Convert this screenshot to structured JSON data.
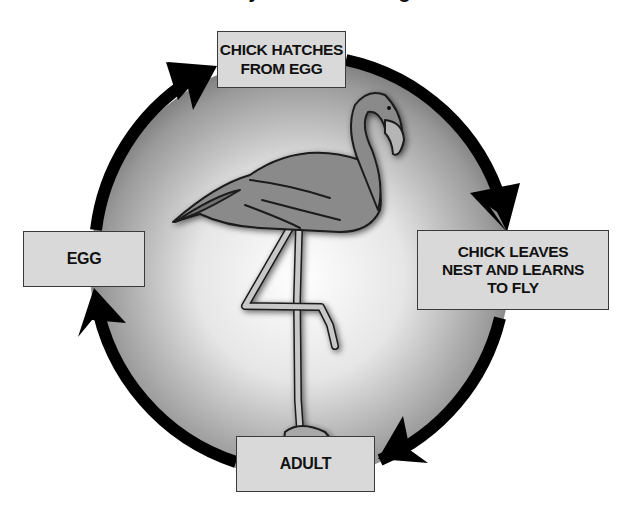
{
  "title_fragment": "Life Cycle of a Flamingo",
  "diagram": {
    "type": "cycle",
    "center_image": "flamingo standing on one leg",
    "stages": [
      {
        "id": "egg",
        "lines": [
          "EGG"
        ]
      },
      {
        "id": "chick_hatches",
        "lines": [
          "CHICK HATCHES",
          "FROM EGG"
        ]
      },
      {
        "id": "chick_leaves",
        "lines": [
          "CHICK LEAVES",
          "NEST AND LEARNS",
          "TO FLY"
        ]
      },
      {
        "id": "adult",
        "lines": [
          "ADULT"
        ]
      }
    ],
    "flow": [
      "egg",
      "chick_hatches",
      "chick_leaves",
      "adult",
      "egg"
    ],
    "arrow_direction": "clockwise",
    "colors": {
      "ring": "#000000",
      "circle_center": "#ffffff",
      "circle_edge": "#7a7a7a",
      "box_fill": "#d9d9d9",
      "box_border": "#3a3a3a",
      "text": "#111111"
    }
  }
}
